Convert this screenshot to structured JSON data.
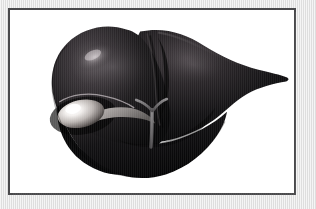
{
  "page": {
    "background_color": "#e9e9e9",
    "width": 316,
    "height": 209
  },
  "figure": {
    "frame_color": "#4a4a4c",
    "frame_background": "#ffffff",
    "title": "",
    "caption": "",
    "illustration_style": "airbrushed grayscale medical illustration"
  },
  "anatomy": {
    "organ_name": "liver",
    "organ_color_dark": "#0b0b0c",
    "organ_color_mid": "#2a2729",
    "organ_color_highlight": "#9b9498",
    "parts": [
      {
        "name": "left-lobe",
        "label": "",
        "color": "#19171a"
      },
      {
        "name": "right-lobe",
        "label": "",
        "color": "#0d0c0e"
      },
      {
        "name": "falciform-ligament",
        "label": "",
        "color": "#3b3739"
      },
      {
        "name": "gallbladder",
        "label": "",
        "color": "#efeceb"
      },
      {
        "name": "cystic-duct",
        "label": "",
        "color": "#8d8a88"
      },
      {
        "name": "portal-vein",
        "label": "",
        "color": "#6b6a6c"
      },
      {
        "name": "hepatic-artery",
        "label": "",
        "color": "#6b6a6c"
      },
      {
        "name": "inferior-tip",
        "label": "",
        "color": "#0a0a0b"
      }
    ]
  }
}
